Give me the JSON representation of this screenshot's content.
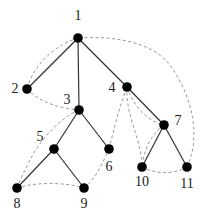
{
  "diagram": {
    "type": "tree-with-threading",
    "nodes": [
      {
        "id": "1",
        "label": "1",
        "x": 78,
        "y": 38,
        "lx": 78,
        "ly": 20,
        "anchor": "middle"
      },
      {
        "id": "2",
        "label": "2",
        "x": 27,
        "y": 89,
        "lx": 15,
        "ly": 93,
        "anchor": "middle"
      },
      {
        "id": "3",
        "label": "3",
        "x": 79,
        "y": 110,
        "lx": 67,
        "ly": 104,
        "anchor": "middle"
      },
      {
        "id": "4",
        "label": "4",
        "x": 127,
        "y": 87,
        "lx": 112,
        "ly": 92,
        "anchor": "middle"
      },
      {
        "id": "5",
        "label": "5",
        "x": 54,
        "y": 149,
        "lx": 40,
        "ly": 141,
        "anchor": "middle"
      },
      {
        "id": "6",
        "label": "6",
        "x": 109,
        "y": 149,
        "lx": 109,
        "ly": 171,
        "anchor": "middle"
      },
      {
        "id": "7",
        "label": "7",
        "x": 164,
        "y": 125,
        "lx": 178,
        "ly": 125,
        "anchor": "middle"
      },
      {
        "id": "8",
        "label": "8",
        "x": 17,
        "y": 188,
        "lx": 17,
        "ly": 208,
        "anchor": "middle"
      },
      {
        "id": "9",
        "label": "9",
        "x": 84,
        "y": 188,
        "lx": 84,
        "ly": 208,
        "anchor": "middle"
      },
      {
        "id": "10",
        "label": "10",
        "x": 142,
        "y": 167,
        "lx": 142,
        "ly": 186,
        "anchor": "middle"
      },
      {
        "id": "11",
        "label": "11",
        "x": 187,
        "y": 167,
        "lx": 187,
        "ly": 188,
        "anchor": "middle"
      }
    ],
    "tree_edges": [
      [
        "1",
        "2"
      ],
      [
        "1",
        "3"
      ],
      [
        "1",
        "4"
      ],
      [
        "3",
        "5"
      ],
      [
        "3",
        "6"
      ],
      [
        "5",
        "8"
      ],
      [
        "5",
        "9"
      ],
      [
        "4",
        "7"
      ],
      [
        "7",
        "10"
      ],
      [
        "7",
        "11"
      ]
    ],
    "dashed_paths": [
      {
        "from": "1",
        "to": "2",
        "d": "M78,38 C55,45 33,65 27,89"
      },
      {
        "from": "2",
        "to": "3",
        "d": "M27,89 C40,103 60,108 79,110"
      },
      {
        "from": "3",
        "to": "8",
        "d": "M79,110 C60,118 40,140 30,160 C25,170 20,180 17,188"
      },
      {
        "from": "8",
        "to": "9",
        "d": "M17,188 C35,182 65,182 84,188"
      },
      {
        "from": "9",
        "to": "6",
        "d": "M84,188 C95,180 103,162 109,149"
      },
      {
        "from": "6",
        "to": "4",
        "d": "M109,149 C115,125 120,105 127,87"
      },
      {
        "from": "4",
        "to": "10",
        "d": "M127,87 C125,115 142,140 142,167"
      },
      {
        "from": "4",
        "to": "7",
        "d": "M127,87 C135,110 150,122 164,125"
      },
      {
        "from": "7",
        "to": "10",
        "d": "M164,125 C150,135 144,150 142,167"
      },
      {
        "from": "10",
        "to": "11",
        "d": "M142,167 C157,175 175,174 187,167"
      },
      {
        "from": "11",
        "to": "1",
        "d": "M187,167 C200,140 195,100 170,65 C150,40 110,36 78,38"
      }
    ]
  }
}
